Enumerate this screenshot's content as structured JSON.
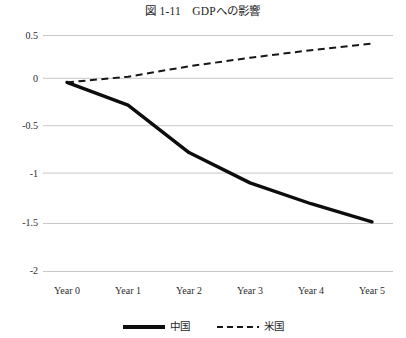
{
  "chart_data": {
    "type": "line",
    "title": "図 1-11　GDPへの影響",
    "xlabel": "",
    "ylabel": "",
    "categories": [
      "Year 0",
      "Year 1",
      "Year 2",
      "Year 3",
      "Year 4",
      "Year 5"
    ],
    "ylim": [
      -2,
      0.5
    ],
    "yticks": [
      0.5,
      0,
      -0.5,
      -1,
      -1.5,
      -2
    ],
    "ytick_labels": [
      "0.5",
      "0",
      "-0.5",
      "-1",
      "-1.5",
      "-2"
    ],
    "grid": "horizontal",
    "legend_position": "bottom",
    "series": [
      {
        "name": "中国",
        "style": "solid",
        "color": "#0d0d0d",
        "width": 3.2,
        "values": [
          0,
          -0.24,
          -0.74,
          -1.06,
          -1.28,
          -1.47
        ]
      },
      {
        "name": "米国",
        "style": "dashed",
        "color": "#161616",
        "width": 2.0,
        "values": [
          0,
          0.06,
          0.17,
          0.26,
          0.34,
          0.41
        ]
      }
    ]
  },
  "colors": {
    "background": "#ffffff",
    "gridline": "#c8c8c8",
    "text": "#1d1d1d",
    "series_china": "#0d0d0d",
    "series_usa": "#161616"
  }
}
